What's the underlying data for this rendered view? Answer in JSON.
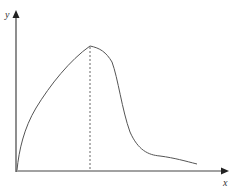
{
  "diagram": {
    "type": "single-peak curve on axes",
    "axes": {
      "x_label": "x",
      "y_label": "y",
      "color": "#444444"
    },
    "curve": {
      "color": "#555555",
      "description": "Rises steeply from origin, peaks, drops sharply, then tails off",
      "points": [
        [
          17,
          170
        ],
        [
          22,
          140
        ],
        [
          35,
          110
        ],
        [
          55,
          80
        ],
        [
          75,
          57
        ],
        [
          90,
          46
        ],
        [
          100,
          49
        ],
        [
          110,
          58
        ],
        [
          118,
          75
        ],
        [
          122,
          100
        ],
        [
          130,
          130
        ],
        [
          140,
          148
        ],
        [
          152,
          156
        ],
        [
          170,
          158
        ],
        [
          185,
          161
        ],
        [
          197,
          164
        ]
      ]
    },
    "peak_marker": {
      "style": "dashed vertical line",
      "x": 90,
      "y_top": 46,
      "y_bottom": 171
    }
  }
}
